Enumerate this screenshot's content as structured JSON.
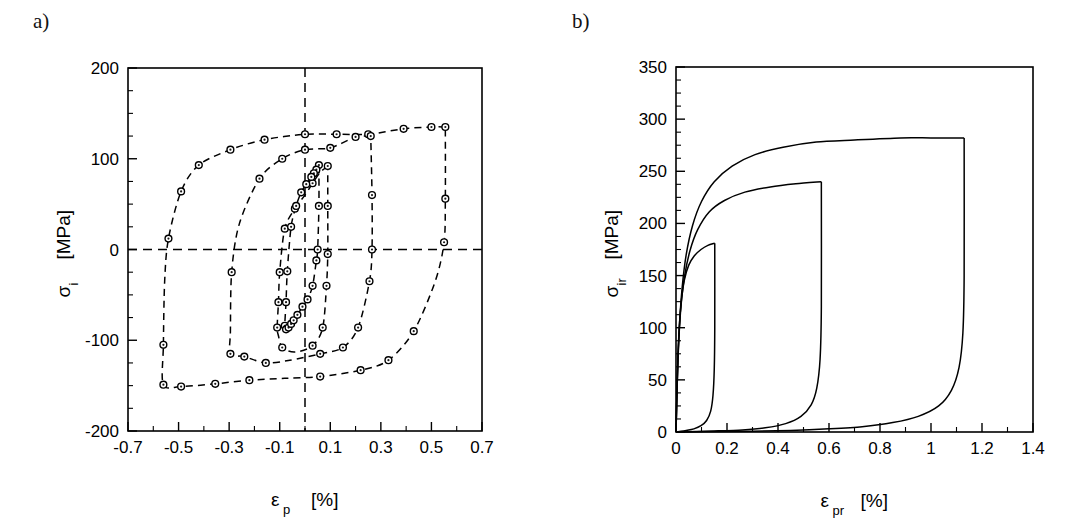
{
  "figure": {
    "background": "#ffffff",
    "ink_color": "#000000",
    "panels": [
      {
        "id": "a",
        "label": "a)",
        "xaxis": {
          "title_symbol": "ε",
          "title_sub": "p",
          "title_unit": "[%]",
          "min": -0.7,
          "max": 0.7,
          "major_ticks": [
            -0.7,
            -0.5,
            -0.3,
            -0.1,
            0.1,
            0.3,
            0.5,
            0.7
          ],
          "tick_labels": [
            "-0.7",
            "-0.5",
            "-0.3",
            "-0.1",
            "0.1",
            "0.3",
            "0.5",
            "0.7"
          ],
          "minor_step": 0.1
        },
        "yaxis": {
          "title_symbol": "σ",
          "title_sub": "i",
          "title_unit": "[MPa]",
          "min": -200,
          "max": 200,
          "major_ticks": [
            -200,
            -100,
            0,
            100,
            200
          ],
          "tick_labels": [
            "-200",
            "-100",
            "0",
            "100",
            "200"
          ],
          "minor_step": 25
        },
        "reference_lines": [
          {
            "name": "horizontal-zero-line",
            "orientation": "horizontal",
            "value": 0
          },
          {
            "name": "vertical-zero-line",
            "orientation": "vertical",
            "value": 0
          }
        ]
      },
      {
        "id": "b",
        "label": "b)",
        "xaxis": {
          "title_symbol": "ε",
          "title_sub": "pr",
          "title_unit": "[%]",
          "min": 0,
          "max": 1.4,
          "major_ticks": [
            0,
            0.2,
            0.4,
            0.6,
            0.8,
            1.0,
            1.2,
            1.4
          ],
          "tick_labels": [
            "0",
            "0.2",
            "0.4",
            "0.6",
            "0.8",
            "1",
            "1.2",
            "1.4"
          ],
          "minor_step": 0.1
        },
        "yaxis": {
          "title_symbol": "σ",
          "title_sub": "ir",
          "title_unit": "[MPa]",
          "min": 0,
          "max": 350,
          "major_ticks": [
            0,
            50,
            100,
            150,
            200,
            250,
            300,
            350
          ],
          "tick_labels": [
            "0",
            "50",
            "100",
            "150",
            "200",
            "250",
            "300",
            "350"
          ],
          "minor_step": 12.5
        },
        "reference_lines": []
      }
    ]
  },
  "chart_data": [
    {
      "type": "line",
      "panel": "a",
      "title": "",
      "xlabel": "ε_p [%]",
      "ylabel": "σ_i [MPa]",
      "xlim": [
        -0.7,
        0.7
      ],
      "ylim": [
        -200,
        200
      ],
      "grid": false,
      "legend": "none",
      "linestyle": "dashed",
      "marker": "open-circle",
      "annotations": [
        "dashed horizontal reference at sigma_i = 0",
        "dashed vertical reference at epsilon_p = 0"
      ],
      "series": [
        {
          "name": "hysteresis-loop-1-innermost",
          "points": [
            [
              0.055,
              93
            ],
            [
              0.045,
              88
            ],
            [
              0.035,
              84
            ],
            [
              0.025,
              80
            ],
            [
              0.005,
              72
            ],
            [
              -0.015,
              63
            ],
            [
              -0.035,
              48
            ],
            [
              -0.055,
              25
            ],
            [
              -0.07,
              -24
            ],
            [
              -0.075,
              -58
            ],
            [
              -0.08,
              -84
            ],
            [
              -0.075,
              -88
            ],
            [
              -0.065,
              -86
            ],
            [
              -0.055,
              -82
            ],
            [
              -0.045,
              -78
            ],
            [
              -0.03,
              -72
            ],
            [
              -0.01,
              -63
            ],
            [
              0.01,
              -55
            ],
            [
              0.03,
              -40
            ],
            [
              0.045,
              -12
            ],
            [
              0.05,
              0
            ],
            [
              0.055,
              48
            ],
            [
              0.055,
              93
            ]
          ]
        },
        {
          "name": "hysteresis-loop-2",
          "points": [
            [
              0.09,
              92
            ],
            [
              0.06,
              85
            ],
            [
              0.03,
              73
            ],
            [
              0.0,
              60
            ],
            [
              -0.04,
              45
            ],
            [
              -0.08,
              23
            ],
            [
              -0.1,
              -25
            ],
            [
              -0.105,
              -58
            ],
            [
              -0.11,
              -86
            ],
            [
              -0.105,
              -95
            ],
            [
              -0.09,
              -108
            ],
            [
              -0.04,
              -113
            ],
            [
              0.03,
              -106
            ],
            [
              0.07,
              -86
            ],
            [
              0.085,
              -40
            ],
            [
              0.09,
              -5
            ],
            [
              0.09,
              48
            ],
            [
              0.09,
              92
            ]
          ]
        },
        {
          "name": "hysteresis-loop-3",
          "points": [
            [
              0.26,
              125
            ],
            [
              0.2,
              124
            ],
            [
              0.1,
              112
            ],
            [
              0.0,
              110
            ],
            [
              -0.09,
              100
            ],
            [
              -0.18,
              78
            ],
            [
              -0.26,
              28
            ],
            [
              -0.29,
              -25
            ],
            [
              -0.295,
              -90
            ],
            [
              -0.295,
              -115
            ],
            [
              -0.24,
              -118
            ],
            [
              -0.155,
              -125
            ],
            [
              -0.06,
              -122
            ],
            [
              0.06,
              -115
            ],
            [
              0.15,
              -108
            ],
            [
              0.21,
              -86
            ],
            [
              0.255,
              -35
            ],
            [
              0.265,
              0
            ],
            [
              0.265,
              60
            ],
            [
              0.26,
              125
            ]
          ]
        },
        {
          "name": "hysteresis-loop-4-outermost",
          "points": [
            [
              0.555,
              135
            ],
            [
              0.5,
              135
            ],
            [
              0.39,
              133
            ],
            [
              0.25,
              127
            ],
            [
              0.125,
              127
            ],
            [
              0.0,
              127
            ],
            [
              -0.16,
              121
            ],
            [
              -0.295,
              110
            ],
            [
              -0.42,
              93
            ],
            [
              -0.49,
              64
            ],
            [
              -0.54,
              12
            ],
            [
              -0.555,
              -35
            ],
            [
              -0.56,
              -105
            ],
            [
              -0.56,
              -149
            ],
            [
              -0.49,
              -151
            ],
            [
              -0.355,
              -148
            ],
            [
              -0.22,
              -144
            ],
            [
              -0.08,
              -142
            ],
            [
              0.06,
              -140
            ],
            [
              0.22,
              -133
            ],
            [
              0.33,
              -122
            ],
            [
              0.43,
              -90
            ],
            [
              0.515,
              -35
            ],
            [
              0.55,
              8
            ],
            [
              0.555,
              56
            ],
            [
              0.555,
              135
            ]
          ]
        }
      ],
      "markers_loop_1": [
        [
          0.055,
          93
        ],
        [
          0.045,
          88
        ],
        [
          0.035,
          84
        ],
        [
          0.025,
          80
        ],
        [
          0.005,
          72
        ],
        [
          -0.015,
          63
        ],
        [
          -0.035,
          48
        ],
        [
          -0.055,
          25
        ],
        [
          -0.07,
          -24
        ],
        [
          -0.075,
          -58
        ],
        [
          -0.08,
          -84
        ],
        [
          -0.075,
          -88
        ],
        [
          -0.065,
          -86
        ],
        [
          -0.055,
          -82
        ],
        [
          -0.045,
          -78
        ],
        [
          -0.03,
          -72
        ],
        [
          -0.01,
          -63
        ],
        [
          0.01,
          -55
        ],
        [
          0.03,
          -40
        ],
        [
          0.045,
          -12
        ],
        [
          0.05,
          0
        ],
        [
          0.055,
          48
        ]
      ],
      "markers_loop_2": [
        [
          0.09,
          92
        ],
        [
          0.03,
          73
        ],
        [
          -0.04,
          45
        ],
        [
          -0.08,
          23
        ],
        [
          -0.1,
          -25
        ],
        [
          -0.105,
          -58
        ],
        [
          -0.11,
          -86
        ],
        [
          -0.09,
          -108
        ],
        [
          0.03,
          -106
        ],
        [
          0.07,
          -86
        ],
        [
          0.085,
          -40
        ],
        [
          0.09,
          -5
        ],
        [
          0.09,
          48
        ]
      ],
      "markers_loop_3": [
        [
          0.26,
          125
        ],
        [
          0.2,
          124
        ],
        [
          0.1,
          112
        ],
        [
          0.0,
          110
        ],
        [
          -0.09,
          100
        ],
        [
          -0.18,
          78
        ],
        [
          -0.29,
          -25
        ],
        [
          -0.295,
          -115
        ],
        [
          -0.24,
          -118
        ],
        [
          -0.155,
          -125
        ],
        [
          0.06,
          -115
        ],
        [
          0.15,
          -108
        ],
        [
          0.21,
          -86
        ],
        [
          0.255,
          -35
        ],
        [
          0.265,
          0
        ],
        [
          0.265,
          60
        ]
      ],
      "markers_loop_4": [
        [
          0.555,
          135
        ],
        [
          0.5,
          135
        ],
        [
          0.39,
          133
        ],
        [
          0.25,
          127
        ],
        [
          0.125,
          127
        ],
        [
          0.0,
          127
        ],
        [
          -0.16,
          121
        ],
        [
          -0.295,
          110
        ],
        [
          -0.42,
          93
        ],
        [
          -0.49,
          64
        ],
        [
          -0.54,
          12
        ],
        [
          -0.56,
          -105
        ],
        [
          -0.56,
          -149
        ],
        [
          -0.49,
          -151
        ],
        [
          -0.355,
          -148
        ],
        [
          -0.22,
          -144
        ],
        [
          0.06,
          -140
        ],
        [
          0.22,
          -133
        ],
        [
          0.33,
          -122
        ],
        [
          0.43,
          -90
        ],
        [
          0.55,
          8
        ],
        [
          0.555,
          56
        ]
      ]
    },
    {
      "type": "line",
      "panel": "b",
      "title": "",
      "xlabel": "ε_pr [%]",
      "ylabel": "σ_ir [MPa]",
      "xlim": [
        0,
        1.4
      ],
      "ylim": [
        0,
        350
      ],
      "grid": false,
      "legend": "none",
      "linestyle": "solid",
      "marker": "none",
      "series": [
        {
          "name": "reversed-loop-1-smallest",
          "loading": [
            [
              0.0,
              0
            ],
            [
              0.004,
              40
            ],
            [
              0.008,
              75
            ],
            [
              0.014,
              105
            ],
            [
              0.022,
              128
            ],
            [
              0.033,
              146
            ],
            [
              0.05,
              160
            ],
            [
              0.072,
              169
            ],
            [
              0.098,
              175
            ],
            [
              0.125,
              179
            ],
            [
              0.152,
              181
            ]
          ],
          "unloading": [
            [
              0.152,
              181
            ],
            [
              0.152,
              100
            ],
            [
              0.15,
              60
            ],
            [
              0.145,
              35
            ],
            [
              0.136,
              20
            ],
            [
              0.12,
              11
            ],
            [
              0.098,
              6
            ],
            [
              0.07,
              3
            ],
            [
              0.04,
              1.5
            ],
            [
              0.0,
              0
            ]
          ]
        },
        {
          "name": "reversed-loop-2",
          "loading": [
            [
              0.0,
              0
            ],
            [
              0.005,
              48
            ],
            [
              0.011,
              88
            ],
            [
              0.02,
              122
            ],
            [
              0.034,
              150
            ],
            [
              0.055,
              174
            ],
            [
              0.085,
              194
            ],
            [
              0.13,
              211
            ],
            [
              0.19,
              222
            ],
            [
              0.27,
              230
            ],
            [
              0.37,
              235
            ],
            [
              0.47,
              238
            ],
            [
              0.57,
              240
            ]
          ],
          "unloading": [
            [
              0.57,
              240
            ],
            [
              0.57,
              120
            ],
            [
              0.565,
              70
            ],
            [
              0.552,
              42
            ],
            [
              0.53,
              26
            ],
            [
              0.49,
              15
            ],
            [
              0.43,
              8
            ],
            [
              0.35,
              4
            ],
            [
              0.26,
              2
            ],
            [
              0.15,
              1
            ],
            [
              0.0,
              0
            ]
          ]
        },
        {
          "name": "reversed-loop-3-largest",
          "loading": [
            [
              0.0,
              0
            ],
            [
              0.006,
              58
            ],
            [
              0.013,
              100
            ],
            [
              0.024,
              138
            ],
            [
              0.04,
              170
            ],
            [
              0.065,
              198
            ],
            [
              0.1,
              221
            ],
            [
              0.15,
              240
            ],
            [
              0.22,
              255
            ],
            [
              0.31,
              266
            ],
            [
              0.42,
              273
            ],
            [
              0.55,
              278
            ],
            [
              0.7,
              280
            ],
            [
              0.88,
              282
            ],
            [
              1.0,
              282
            ],
            [
              1.13,
              282
            ]
          ],
          "unloading": [
            [
              1.13,
              282
            ],
            [
              1.13,
              150
            ],
            [
              1.125,
              95
            ],
            [
              1.11,
              62
            ],
            [
              1.08,
              40
            ],
            [
              1.03,
              25
            ],
            [
              0.95,
              15
            ],
            [
              0.85,
              9
            ],
            [
              0.73,
              5
            ],
            [
              0.6,
              3
            ],
            [
              0.45,
              1.5
            ],
            [
              0.3,
              0.8
            ],
            [
              0.0,
              0
            ]
          ]
        }
      ]
    }
  ]
}
